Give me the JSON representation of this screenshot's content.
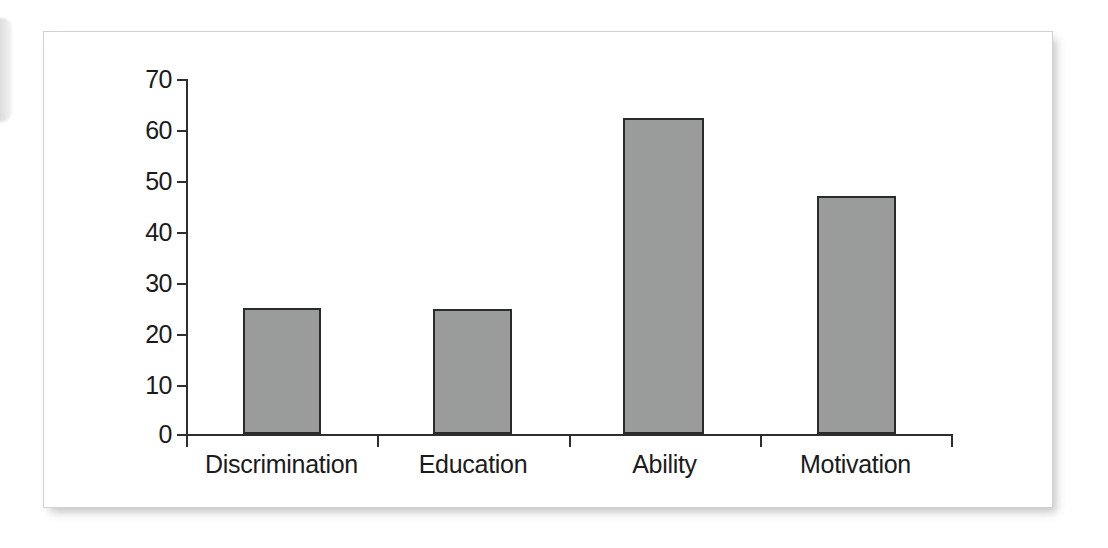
{
  "chart_data": {
    "type": "bar",
    "title": "",
    "subtitle": "",
    "xlabel": "",
    "ylabel": "",
    "categories": [
      "Discrimination",
      "Education",
      "Ability",
      "Motivation"
    ],
    "values": [
      24.8,
      24.6,
      62.3,
      47.0
    ],
    "ylim": [
      0,
      70
    ],
    "ytick_labels": [
      "70",
      "60",
      "50",
      "40",
      "30",
      "20",
      "10",
      "0"
    ],
    "ytick_values": [
      70,
      60,
      50,
      40,
      30,
      20,
      10,
      0
    ],
    "grid": false,
    "legend": null,
    "legend_position": "none",
    "bar_fill_color": "#9a9b9b",
    "bar_border_color": "#2b2b2b",
    "axis_color": "#2e2e2e",
    "panel_background": "#ffffff",
    "panel_border_color": "#d2d2d2",
    "annotations": []
  }
}
